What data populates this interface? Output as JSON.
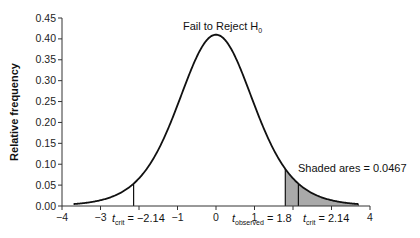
{
  "chart_data": {
    "type": "area",
    "title": "",
    "subtitle": "",
    "xlabel": "",
    "ylabel": "Relative frequency",
    "xlim": [
      -4,
      4
    ],
    "ylim": [
      0,
      0.45
    ],
    "grid": false,
    "legend": null,
    "x_ticks": [
      -4,
      -3,
      -1,
      0,
      1,
      4
    ],
    "x_tick_labels": [
      "−4",
      "−3",
      "−1",
      "0",
      "1",
      "4"
    ],
    "y_ticks": [
      0.0,
      0.05,
      0.1,
      0.15,
      0.2,
      0.25,
      0.3,
      0.35,
      0.4,
      0.45
    ],
    "y_tick_labels": [
      "0.00",
      "0.05",
      "0.10",
      "0.15",
      "0.20",
      "0.25",
      "0.30",
      "0.35",
      "0.40",
      "0.45"
    ],
    "series": [
      {
        "name": "t-distribution density",
        "x": [
          -3.7,
          -3.5,
          -3.0,
          -2.5,
          -2.14,
          -2.0,
          -1.5,
          -1.0,
          -0.5,
          0.0,
          0.5,
          1.0,
          1.5,
          1.8,
          2.0,
          2.14,
          2.5,
          3.0,
          3.5,
          3.7
        ],
        "y": [
          0.018,
          0.02,
          0.03,
          0.05,
          0.075,
          0.085,
          0.14,
          0.24,
          0.35,
          0.41,
          0.35,
          0.24,
          0.14,
          0.105,
          0.085,
          0.075,
          0.05,
          0.03,
          0.02,
          0.018
        ]
      }
    ],
    "shaded_region": {
      "x_from": 1.8,
      "x_to": 3.7,
      "area": 0.0467
    },
    "vertical_lines": [
      {
        "x": -2.14,
        "label": "t_crit = −2.14"
      },
      {
        "x": 1.8,
        "label": "t_observed = 1.8"
      },
      {
        "x": 2.14,
        "label": "t_crit = 2.14"
      }
    ],
    "annotations": [
      {
        "text": "Fail to Reject H0",
        "x": 0,
        "y": 0.425
      },
      {
        "text": "Shaded ares = 0.0467",
        "x": 2.9,
        "y": 0.075
      }
    ]
  },
  "labels": {
    "ylabel": "Relative frequency",
    "fail_to_reject": "Fail to Reject H",
    "fail_to_reject_sub": "0",
    "shaded_area": "Shaded ares = 0.0467",
    "tcrit_left_t": "t",
    "tcrit_left_sub": "crit",
    "tcrit_left_value": " = −2.14",
    "tobs_t": "t",
    "tobs_sub": "observed",
    "tobs_value": " = 1.8",
    "tcrit_right_t": "t",
    "tcrit_right_sub": "crit",
    "tcrit_right_value": " = 2.14"
  },
  "colors": {
    "curve": "#111111",
    "shade": "#a9a9a9",
    "axis": "#333333"
  }
}
